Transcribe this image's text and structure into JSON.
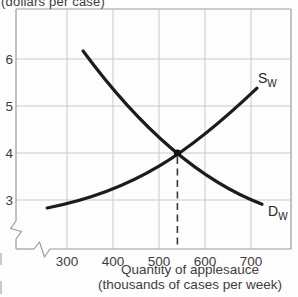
{
  "chart_data": {
    "type": "line",
    "ylabel": "(dollars per case)",
    "xlabel": "Quantity of applesauce (thousands of cases per week)",
    "xlabel_line1": "Quantity of applesauce",
    "xlabel_line2": "(thousands of cases per week)",
    "x_ticks": [
      300,
      400,
      500,
      600,
      700
    ],
    "y_ticks": [
      3,
      4,
      5,
      6
    ],
    "xlim": [
      190,
      790
    ],
    "ylim": [
      1.95,
      7.05
    ],
    "grid": true,
    "x_axis_break": true,
    "y_axis_break": true,
    "legend_position": "on-curve",
    "equilibrium": {
      "quantity": 540,
      "price": 4
    },
    "series": [
      {
        "name": "supply",
        "label": "S",
        "label_sub": "W",
        "curve": "bezier",
        "bezier_points": [
          [
            257,
            2.83
          ],
          [
            448,
            3.19
          ],
          [
            567,
            4.02
          ],
          [
            713,
            5.38
          ]
        ]
      },
      {
        "name": "demand",
        "label": "D",
        "label_sub": "W",
        "curve": "bezier",
        "bezier_points": [
          [
            335,
            6.17
          ],
          [
            524,
            3.66
          ],
          [
            724,
            2.91
          ]
        ]
      }
    ],
    "colors": {
      "curve": "#1c1c1c",
      "grid": "#c9c9c9",
      "axis": "#9b9b9b",
      "text": "#3d3d3d",
      "dashed": "#383838",
      "dot": "#111111"
    }
  }
}
